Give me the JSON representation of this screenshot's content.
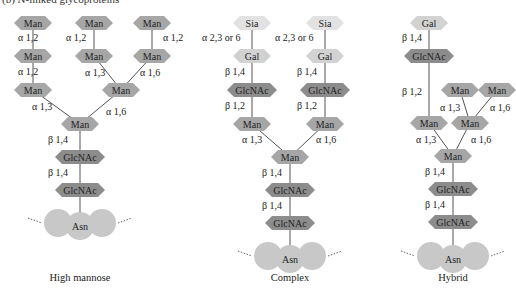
{
  "header": "(b)   N-linked glycoproteins",
  "colors": {
    "Man": "#a6a6a6",
    "GlcNAc": "#8c8c8c",
    "Gal": "#d2d2d2",
    "Sia": "#e2e2e2",
    "Asn": "#c8c8c8",
    "line": "#555555",
    "text": "#222222"
  },
  "panels": [
    {
      "name": "high-mannose",
      "caption": "High mannose",
      "nodes": [
        {
          "id": "m1",
          "label": "Man",
          "type": "Man",
          "x": 33,
          "y": 23
        },
        {
          "id": "m2",
          "label": "Man",
          "type": "Man",
          "x": 33,
          "y": 56
        },
        {
          "id": "m3",
          "label": "Man",
          "type": "Man",
          "x": 33,
          "y": 90
        },
        {
          "id": "m4",
          "label": "Man",
          "type": "Man",
          "x": 94,
          "y": 23
        },
        {
          "id": "m5",
          "label": "Man",
          "type": "Man",
          "x": 94,
          "y": 56
        },
        {
          "id": "m6",
          "label": "Man",
          "type": "Man",
          "x": 152,
          "y": 23
        },
        {
          "id": "m7",
          "label": "Man",
          "type": "Man",
          "x": 152,
          "y": 56
        },
        {
          "id": "m8",
          "label": "Man",
          "type": "Man",
          "x": 121,
          "y": 90
        },
        {
          "id": "m9",
          "label": "Man",
          "type": "Man",
          "x": 80,
          "y": 124
        },
        {
          "id": "g1",
          "label": "GlcNAc",
          "type": "GlcNAc",
          "x": 80,
          "y": 157
        },
        {
          "id": "g2",
          "label": "GlcNAc",
          "type": "GlcNAc",
          "x": 80,
          "y": 190
        },
        {
          "id": "asn",
          "label": "Asn",
          "type": "Asn",
          "x": 80,
          "y": 226
        }
      ],
      "edges": [
        {
          "from": "m1",
          "to": "m2"
        },
        {
          "from": "m2",
          "to": "m3"
        },
        {
          "from": "m4",
          "to": "m5"
        },
        {
          "from": "m6",
          "to": "m7"
        },
        {
          "from": "m5",
          "to": "m8"
        },
        {
          "from": "m7",
          "to": "m8"
        },
        {
          "from": "m3",
          "to": "m9"
        },
        {
          "from": "m8",
          "to": "m9"
        },
        {
          "from": "m9",
          "to": "g1"
        },
        {
          "from": "g1",
          "to": "g2"
        },
        {
          "from": "g2",
          "to": "asn"
        }
      ],
      "linkages": [
        {
          "text": "α 1,2",
          "x": 18,
          "y": 41
        },
        {
          "text": "α 1,2",
          "x": 18,
          "y": 75
        },
        {
          "text": "α 1,2",
          "x": 66,
          "y": 41
        },
        {
          "text": "α 1,2",
          "x": 163,
          "y": 41
        },
        {
          "text": "α 1,3",
          "x": 85,
          "y": 76
        },
        {
          "text": "α 1,6",
          "x": 140,
          "y": 76
        },
        {
          "text": "α 1,3",
          "x": 32,
          "y": 110
        },
        {
          "text": "α 1,6",
          "x": 106,
          "y": 115
        },
        {
          "text": "β 1,4",
          "x": 48,
          "y": 143
        },
        {
          "text": "β 1,4",
          "x": 48,
          "y": 176
        }
      ],
      "asn_x": 80
    },
    {
      "name": "complex",
      "caption": "Complex",
      "nodes": [
        {
          "id": "s1",
          "label": "Sia",
          "type": "Sia",
          "x": 252,
          "y": 23
        },
        {
          "id": "ga1",
          "label": "Gal",
          "type": "Gal",
          "x": 252,
          "y": 56
        },
        {
          "id": "gn1",
          "label": "GlcNAc",
          "type": "GlcNAc",
          "x": 252,
          "y": 90
        },
        {
          "id": "ma1",
          "label": "Man",
          "type": "Man",
          "x": 252,
          "y": 124
        },
        {
          "id": "s2",
          "label": "Sia",
          "type": "Sia",
          "x": 325,
          "y": 23
        },
        {
          "id": "ga2",
          "label": "Gal",
          "type": "Gal",
          "x": 325,
          "y": 56
        },
        {
          "id": "gn2",
          "label": "GlcNAc",
          "type": "GlcNAc",
          "x": 325,
          "y": 90
        },
        {
          "id": "ma2",
          "label": "Man",
          "type": "Man",
          "x": 325,
          "y": 124
        },
        {
          "id": "mc",
          "label": "Man",
          "type": "Man",
          "x": 290,
          "y": 157
        },
        {
          "id": "gc1",
          "label": "GlcNAc",
          "type": "GlcNAc",
          "x": 290,
          "y": 190
        },
        {
          "id": "gc2",
          "label": "GlcNAc",
          "type": "GlcNAc",
          "x": 290,
          "y": 223
        },
        {
          "id": "asn",
          "label": "Asn",
          "type": "Asn",
          "x": 290,
          "y": 259
        }
      ],
      "edges": [
        {
          "from": "s1",
          "to": "ga1"
        },
        {
          "from": "ga1",
          "to": "gn1"
        },
        {
          "from": "gn1",
          "to": "ma1"
        },
        {
          "from": "s2",
          "to": "ga2"
        },
        {
          "from": "ga2",
          "to": "gn2"
        },
        {
          "from": "gn2",
          "to": "ma2"
        },
        {
          "from": "ma1",
          "to": "mc"
        },
        {
          "from": "ma2",
          "to": "mc"
        },
        {
          "from": "mc",
          "to": "gc1"
        },
        {
          "from": "gc1",
          "to": "gc2"
        },
        {
          "from": "gc2",
          "to": "asn"
        }
      ],
      "linkages": [
        {
          "text": "α 2,3 or 6",
          "x": 202,
          "y": 41
        },
        {
          "text": "α 2,3 or 6",
          "x": 275,
          "y": 41
        },
        {
          "text": "β 1,4",
          "x": 225,
          "y": 75
        },
        {
          "text": "β 1,4",
          "x": 297,
          "y": 75
        },
        {
          "text": "β 1,2",
          "x": 225,
          "y": 109
        },
        {
          "text": "β 1,2",
          "x": 297,
          "y": 109
        },
        {
          "text": "α 1,3",
          "x": 242,
          "y": 143
        },
        {
          "text": "α 1,6",
          "x": 316,
          "y": 143
        },
        {
          "text": "β 1,4",
          "x": 262,
          "y": 176
        },
        {
          "text": "β 1,4",
          "x": 262,
          "y": 209
        }
      ],
      "asn_x": 290
    },
    {
      "name": "hybrid",
      "caption": "Hybrid",
      "nodes": [
        {
          "id": "gal",
          "label": "Gal",
          "type": "Gal",
          "x": 429,
          "y": 23
        },
        {
          "id": "gn",
          "label": "GlcNAc",
          "type": "GlcNAc",
          "x": 429,
          "y": 56
        },
        {
          "id": "mL",
          "label": "Man",
          "type": "Man",
          "x": 429,
          "y": 123
        },
        {
          "id": "mR1",
          "label": "Man",
          "type": "Man",
          "x": 460,
          "y": 90
        },
        {
          "id": "mR2",
          "label": "Man",
          "type": "Man",
          "x": 497,
          "y": 90
        },
        {
          "id": "mR",
          "label": "Man",
          "type": "Man",
          "x": 470,
          "y": 123
        },
        {
          "id": "mc",
          "label": "Man",
          "type": "Man",
          "x": 453,
          "y": 156
        },
        {
          "id": "g1",
          "label": "GlcNAc",
          "type": "GlcNAc",
          "x": 453,
          "y": 189
        },
        {
          "id": "g2",
          "label": "GlcNAc",
          "type": "GlcNAc",
          "x": 453,
          "y": 222
        },
        {
          "id": "asn",
          "label": "Asn",
          "type": "Asn",
          "x": 453,
          "y": 259
        }
      ],
      "edges": [
        {
          "from": "gal",
          "to": "gn"
        },
        {
          "from": "gn",
          "to": "mL"
        },
        {
          "from": "mR1",
          "to": "mR"
        },
        {
          "from": "mR2",
          "to": "mR"
        },
        {
          "from": "mL",
          "to": "mc"
        },
        {
          "from": "mR",
          "to": "mc"
        },
        {
          "from": "mc",
          "to": "g1"
        },
        {
          "from": "g1",
          "to": "g2"
        },
        {
          "from": "g2",
          "to": "asn"
        }
      ],
      "linkages": [
        {
          "text": "β 1,4",
          "x": 402,
          "y": 41
        },
        {
          "text": "β 1,2",
          "x": 402,
          "y": 95
        },
        {
          "text": "α 1,3",
          "x": 440,
          "y": 111
        },
        {
          "text": "α 1,6",
          "x": 490,
          "y": 111
        },
        {
          "text": "α 1,3",
          "x": 416,
          "y": 143
        },
        {
          "text": "α 1,6",
          "x": 471,
          "y": 143
        },
        {
          "text": "β 1,4",
          "x": 425,
          "y": 175
        },
        {
          "text": "β 1,4",
          "x": 425,
          "y": 208
        }
      ],
      "asn_x": 453
    }
  ],
  "captions_y": 281
}
